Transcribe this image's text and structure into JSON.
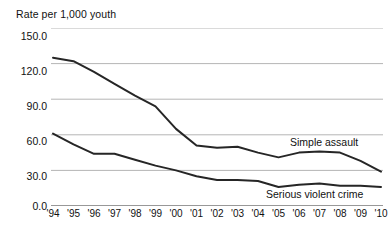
{
  "chart_data": {
    "type": "line",
    "title": "Rate per 1,000 youth",
    "xlabel": "",
    "ylabel": "Rate per 1,000 youth",
    "ylim": [
      0,
      150
    ],
    "yticks": [
      0.0,
      30.0,
      60.0,
      90.0,
      120.0,
      150.0
    ],
    "ytick_labels": [
      "0.0",
      "30.0",
      "60.0",
      "90.0",
      "120.0",
      "150.0"
    ],
    "grid": true,
    "legend_position": "inline-annotation",
    "categories": [
      "'94",
      "'95",
      "'96",
      "'97",
      "'98",
      "'99",
      "'00",
      "'01",
      "'02",
      "'03",
      "'04",
      "'05",
      "'06",
      "'07",
      "'08",
      "'09",
      "'10"
    ],
    "x": [
      1994,
      1995,
      1996,
      1997,
      1998,
      1999,
      2000,
      2001,
      2002,
      2003,
      2004,
      2005,
      2006,
      2007,
      2008,
      2009,
      2010
    ],
    "series": [
      {
        "name": "Simple assault",
        "color": "#262626",
        "values": [
          125.0,
          122.0,
          113.0,
          103.0,
          93.0,
          84.0,
          65.0,
          51.0,
          49.0,
          50.0,
          45.0,
          41.0,
          45.0,
          46.0,
          45.0,
          38.0,
          29.0
        ]
      },
      {
        "name": "Serious violent crime",
        "color": "#262626",
        "values": [
          61.0,
          52.0,
          44.0,
          44.0,
          39.0,
          34.0,
          30.0,
          25.0,
          22.0,
          22.0,
          21.0,
          16.0,
          18.0,
          19.0,
          17.0,
          17.0,
          16.0
        ]
      }
    ],
    "annotations": [
      {
        "text": "Simple assault",
        "series": "Simple assault"
      },
      {
        "text": "Serious violent crime",
        "series": "Serious violent crime"
      }
    ]
  },
  "colors": {
    "line": "#262626",
    "gridline": "#b5b5b5",
    "axis": "#333333",
    "background": "#ffffff",
    "text": "#111111"
  }
}
